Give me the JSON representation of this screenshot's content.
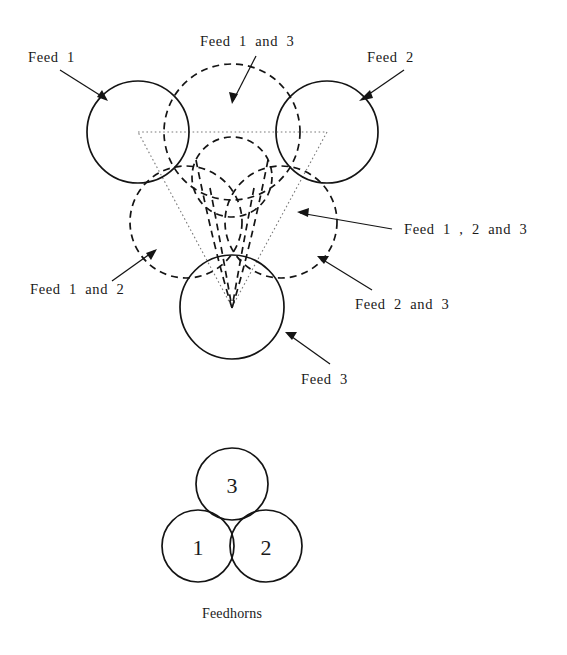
{
  "figure": {
    "title_caption": "Feedhorns",
    "beam_labels": {
      "feed_1": "Feed  1",
      "feed_2": "Feed  2",
      "feed_3": "Feed  3",
      "feed_1_and_3": "Feed  1  and  3",
      "feed_1_and_2": "Feed  1  and  2",
      "feed_2_and_3": "Feed  2  and  3",
      "feed_1_2_and_3": "Feed  1  ,  2  and  3"
    },
    "feedhorns": {
      "horn_1": "1",
      "horn_2": "2",
      "horn_3": "3"
    },
    "colors": {
      "stroke": "#141414",
      "dotted_triangle": "#7a7a7a",
      "background": "#ffffff"
    }
  }
}
